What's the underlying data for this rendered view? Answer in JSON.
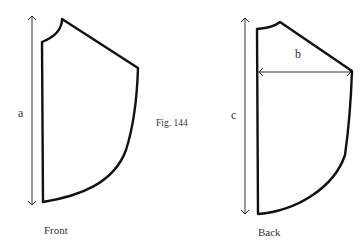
{
  "figure": {
    "caption": "Fig. 144",
    "pieces": [
      {
        "name": "front",
        "label": "Front",
        "measurements": [
          {
            "letter": "a",
            "meaning": "vertical length"
          }
        ]
      },
      {
        "name": "back",
        "label": "Back",
        "measurements": [
          {
            "letter": "b",
            "meaning": "horizontal width"
          },
          {
            "letter": "c",
            "meaning": "vertical length"
          }
        ]
      }
    ],
    "colors": {
      "stroke": "#111111",
      "text": "#333333",
      "background": "#ffffff"
    }
  }
}
